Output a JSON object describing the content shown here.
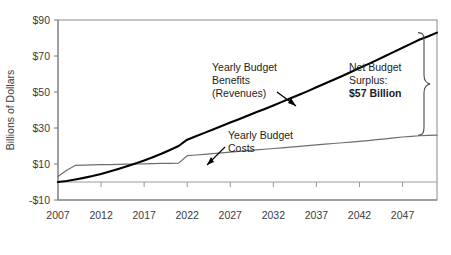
{
  "chart_data": {
    "type": "line",
    "title": "",
    "subtitle": "",
    "xlabel": "",
    "ylabel": "Billions of Dollars",
    "xlim": [
      2007,
      2051
    ],
    "ylim": [
      -10,
      90
    ],
    "grid": false,
    "legend_position": "none",
    "x_ticks": [
      "2007",
      "2012",
      "2017",
      "2022",
      "2027",
      "2032",
      "2037",
      "2042",
      "2047"
    ],
    "x_tick_values": [
      2007,
      2012,
      2017,
      2022,
      2027,
      2032,
      2037,
      2042,
      2047
    ],
    "y_ticks": [
      "-$10",
      "$10",
      "$30",
      "$50",
      "$70",
      "$90"
    ],
    "y_tick_values": [
      -10,
      10,
      30,
      50,
      70,
      90
    ],
    "series": [
      {
        "name": "Yearly Budget Benefits (Revenues)",
        "style": "thick-black",
        "color": "#000000",
        "x": [
          2007,
          2008,
          2009,
          2010,
          2011,
          2012,
          2013,
          2014,
          2015,
          2016,
          2017,
          2018,
          2019,
          2020,
          2021,
          2022,
          2023,
          2024,
          2025,
          2026,
          2027,
          2028,
          2029,
          2030,
          2031,
          2032,
          2033,
          2034,
          2035,
          2036,
          2037,
          2038,
          2039,
          2040,
          2041,
          2042,
          2043,
          2044,
          2045,
          2046,
          2047,
          2048,
          2049,
          2050,
          2051
        ],
        "y": [
          0.0,
          0.6,
          1.4,
          2.3,
          3.3,
          4.5,
          5.8,
          7.2,
          8.7,
          10.3,
          12.0,
          13.8,
          15.7,
          17.8,
          20.0,
          23.5,
          25.4,
          27.3,
          29.2,
          31.1,
          33.0,
          34.9,
          36.8,
          38.7,
          40.6,
          42.5,
          44.5,
          46.5,
          48.5,
          50.5,
          52.6,
          54.7,
          56.8,
          58.9,
          61.1,
          63.3,
          65.5,
          67.7,
          70.0,
          72.3,
          74.6,
          76.9,
          79.2,
          81.0,
          83.0
        ]
      },
      {
        "name": "Yearly Budget Costs",
        "style": "thin-gray",
        "color": "#6e6e6e",
        "x": [
          2007,
          2008,
          2009,
          2010,
          2011,
          2012,
          2013,
          2014,
          2015,
          2016,
          2017,
          2018,
          2019,
          2020,
          2021,
          2022,
          2023,
          2024,
          2025,
          2026,
          2027,
          2028,
          2029,
          2030,
          2031,
          2032,
          2033,
          2034,
          2035,
          2036,
          2037,
          2038,
          2039,
          2040,
          2041,
          2042,
          2043,
          2044,
          2045,
          2046,
          2047,
          2048,
          2049,
          2050,
          2051
        ],
        "y": [
          3.0,
          6.5,
          9.2,
          9.4,
          9.5,
          9.6,
          9.7,
          9.8,
          9.9,
          10.0,
          10.1,
          10.2,
          10.3,
          10.4,
          10.5,
          14.6,
          15.0,
          15.4,
          15.8,
          16.2,
          16.6,
          17.0,
          17.4,
          17.8,
          18.2,
          18.6,
          19.0,
          19.4,
          19.8,
          20.2,
          20.6,
          21.0,
          21.4,
          21.8,
          22.2,
          22.6,
          23.0,
          23.5,
          24.0,
          24.5,
          25.0,
          25.4,
          25.7,
          25.9,
          26.0
        ]
      }
    ],
    "zero_line": 0,
    "annotations": [
      {
        "id": "benefits-label",
        "lines": [
          "Yearly Budget",
          "Benefits",
          "(Revenues)"
        ],
        "has_arrow": true
      },
      {
        "id": "costs-label",
        "lines": [
          "Yearly Budget",
          "Costs"
        ],
        "has_arrow": true
      },
      {
        "id": "surplus-label",
        "lines": [
          "Net Budget",
          "Surplus:"
        ],
        "bold_line": "$57 Billion",
        "has_brace": true,
        "value": 57,
        "unit": "Billion"
      }
    ],
    "colors": {
      "benefits": "#000000",
      "costs": "#6e6e6e",
      "axis": "#7a7a7a",
      "text": "#3b3b3b",
      "background": "#ffffff"
    }
  }
}
